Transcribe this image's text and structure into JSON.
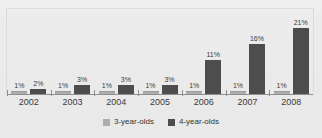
{
  "chart_data": {
    "type": "bar",
    "title": "",
    "subtitle": "",
    "xlabel": "",
    "ylabel": "",
    "categories": [
      "2002",
      "2003",
      "2004",
      "2005",
      "2006",
      "2007",
      "2008"
    ],
    "series": [
      {
        "name": "3-year-olds",
        "color": "#adadad",
        "values": [
          1,
          1,
          1,
          1,
          1,
          1,
          1
        ],
        "labels": [
          "1%",
          "1%",
          "1%",
          "1%",
          "1%",
          "1%",
          "1%"
        ]
      },
      {
        "name": "4-year-olds",
        "color": "#4d4d4d",
        "values": [
          2,
          3,
          3,
          3,
          11,
          16,
          21
        ],
        "labels": [
          "2%",
          "3%",
          "3%",
          "3%",
          "11%",
          "16%",
          "21%"
        ]
      }
    ],
    "ylim": [
      0,
      23
    ],
    "grid": false,
    "legend_position": "bottom",
    "value_unit": "%"
  },
  "legend": {
    "items": [
      {
        "label": "3-year-olds"
      },
      {
        "label": "4-year-olds"
      }
    ]
  }
}
